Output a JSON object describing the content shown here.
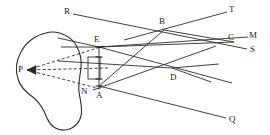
{
  "figure": {
    "kind": "optics-ray-diagram",
    "background_color": "#ffffff",
    "stroke_color": "#2b2b2b",
    "label_color": "#1a1a1a",
    "width": 270,
    "height": 135
  },
  "labels": [
    {
      "id": "R",
      "text": "R",
      "x": 64,
      "y": 7
    },
    {
      "id": "T",
      "text": "T",
      "x": 229,
      "y": 5
    },
    {
      "id": "B",
      "text": "B",
      "x": 159,
      "y": 17
    },
    {
      "id": "E",
      "text": "E",
      "x": 94,
      "y": 35
    },
    {
      "id": "C",
      "text": "C",
      "x": 228,
      "y": 33
    },
    {
      "id": "M",
      "text": "M",
      "x": 249,
      "y": 31
    },
    {
      "id": "S",
      "text": "S",
      "x": 250,
      "y": 45
    },
    {
      "id": "P",
      "text": "P",
      "x": 18,
      "y": 65
    },
    {
      "id": "D",
      "text": "D",
      "x": 170,
      "y": 73
    },
    {
      "id": "N",
      "text": "N",
      "x": 81,
      "y": 87
    },
    {
      "id": "A",
      "text": "A",
      "x": 96,
      "y": 91
    },
    {
      "id": "Q",
      "text": "Q",
      "x": 229,
      "y": 115
    }
  ],
  "points": {
    "P": {
      "x": 27,
      "y": 70
    },
    "E": {
      "x": 99,
      "y": 47
    },
    "A": {
      "x": 99,
      "y": 86
    },
    "N": {
      "x": 90,
      "y": 86
    },
    "B": {
      "x": 164,
      "y": 30
    },
    "C": {
      "x": 234,
      "y": 42
    },
    "D": {
      "x": 172,
      "y": 68
    },
    "R": {
      "x": 73,
      "y": 13
    },
    "T": {
      "x": 227,
      "y": 11
    },
    "M": {
      "x": 248,
      "y": 37
    },
    "S": {
      "x": 247,
      "y": 50
    },
    "Q": {
      "x": 226,
      "y": 118
    }
  },
  "object_blob": {
    "name": "irregular-object-outline",
    "path": "M 46 33 C 36 35 26 42 21 52 C 16 61 15 70 18 79 C 20 87 27 93 34 98 C 40 103 44 110 47 118 C 50 125 56 130 64 130 C 72 130 79 124 81 116 C 83 108 80 100 79 92 C 78 84 80 76 81 68 C 82 60 80 52 76 45 C 72 38 62 32 53 32 C 51 32 48 32 46 33 Z"
  },
  "segments": [
    {
      "name": "ray-R-to-S",
      "from": [
        73,
        14
      ],
      "to": [
        247,
        49
      ]
    },
    {
      "name": "ray-upper-left-to-T",
      "from": [
        124,
        40
      ],
      "to": [
        227,
        12
      ]
    },
    {
      "name": "ray-E-edge-left",
      "from": [
        58,
        38
      ],
      "to": [
        99,
        47
      ]
    },
    {
      "name": "ray-E-to-C",
      "from": [
        99,
        47
      ],
      "to": [
        234,
        42
      ]
    },
    {
      "name": "ray-E-to-D-to-M",
      "from": [
        99,
        47
      ],
      "to": [
        248,
        37
      ]
    },
    {
      "name": "ray-A-to-B-upper",
      "from": [
        99,
        86
      ],
      "to": [
        164,
        30
      ]
    },
    {
      "name": "ray-B-to-C",
      "from": [
        164,
        30
      ],
      "to": [
        234,
        42
      ]
    },
    {
      "name": "ray-A-to-Q",
      "from": [
        99,
        86
      ],
      "to": [
        226,
        118
      ]
    },
    {
      "name": "ray-left-to-D-lower",
      "from": [
        58,
        61
      ],
      "to": [
        172,
        68
      ]
    },
    {
      "name": "ray-D-to-right-horizontal",
      "from": [
        172,
        68
      ],
      "to": [
        219,
        64
      ]
    },
    {
      "name": "ray-D-to-lower-right",
      "from": [
        172,
        68
      ],
      "to": [
        211,
        82
      ]
    },
    {
      "name": "ray-A-to-D-to-upper-right",
      "from": [
        93,
        90
      ],
      "to": [
        216,
        46
      ]
    },
    {
      "name": "ray-E-to-D-lower-right",
      "from": [
        99,
        47
      ],
      "to": [
        232,
        83
      ]
    },
    {
      "name": "segment-E-A-vertical",
      "from": [
        99,
        46
      ],
      "to": [
        99,
        87
      ]
    },
    {
      "name": "chord-left-short",
      "from": [
        61,
        47
      ],
      "to": [
        99,
        47
      ]
    }
  ],
  "dashed_segments": [
    {
      "name": "dashed-ray-P-upper",
      "from": [
        27,
        70
      ],
      "to": [
        104,
        46
      ]
    },
    {
      "name": "dashed-ray-P-middle",
      "from": [
        27,
        70
      ],
      "to": [
        108,
        68
      ]
    },
    {
      "name": "dashed-ray-P-lower",
      "from": [
        27,
        70
      ],
      "to": [
        101,
        89
      ]
    }
  ],
  "arrowhead": {
    "name": "arrowhead-at-P",
    "tip": [
      27,
      70
    ],
    "direction": "left"
  },
  "aperture_rect": {
    "name": "aperture-rectangle",
    "x": 88,
    "y": 57,
    "width": 12,
    "height": 22
  },
  "tick_marks": [
    {
      "name": "tick-at-E",
      "x": 99,
      "y": 47
    },
    {
      "name": "tick-at-A",
      "x": 99,
      "y": 86
    },
    {
      "name": "tick-at-upper-mid",
      "x": 99,
      "y": 57
    },
    {
      "name": "tick-at-lower-mid",
      "x": 99,
      "y": 79
    }
  ]
}
